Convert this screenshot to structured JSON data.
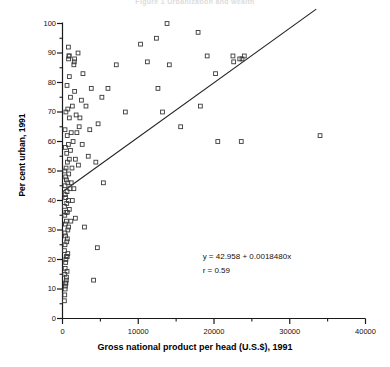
{
  "chart_data": {
    "type": "scatter",
    "title": "Figure 1  Urbanization and wealth",
    "xlabel": "Gross national product per head (U.S.$), 1991",
    "ylabel": "Per cent urban, 1991",
    "xlim": [
      0,
      40000
    ],
    "ylim": [
      0,
      100
    ],
    "xticks": [
      0,
      10000,
      20000,
      30000,
      40000
    ],
    "xtick_labels": [
      "0",
      "10000",
      "20000",
      "30000",
      "40000"
    ],
    "xminor_ticks": [
      5000,
      15000,
      25000,
      35000
    ],
    "yticks": [
      0,
      10,
      20,
      30,
      40,
      50,
      60,
      70,
      80,
      90,
      100
    ],
    "ytick_labels": [
      "0",
      "10",
      "20",
      "30",
      "40",
      "50",
      "60",
      "70",
      "80",
      "90",
      "100"
    ],
    "yminor_ticks": [
      5,
      15,
      25,
      35,
      45,
      55,
      65,
      75,
      85,
      95
    ],
    "grid": false,
    "legend": null,
    "marker": "open-square",
    "annotations": [
      {
        "name": "regression-equation",
        "text": "y = 42.958 + 0.0018480x",
        "x": 18500,
        "y": 21
      },
      {
        "name": "correlation-coefficient",
        "text": "r = 0.59",
        "x": 18500,
        "y": 16
      }
    ],
    "fit_line": {
      "intercept": 42.958,
      "slope": 0.001848,
      "r": 0.59,
      "x_start": 0,
      "x_end": 33500
    },
    "series": [
      {
        "name": "Countries",
        "points": [
          [
            250,
            6
          ],
          [
            300,
            8
          ],
          [
            350,
            10
          ],
          [
            380,
            11
          ],
          [
            420,
            12
          ],
          [
            450,
            12
          ],
          [
            500,
            13
          ],
          [
            520,
            14
          ],
          [
            300,
            15
          ],
          [
            600,
            16
          ],
          [
            350,
            17
          ],
          [
            420,
            19
          ],
          [
            450,
            20
          ],
          [
            500,
            21
          ],
          [
            620,
            21
          ],
          [
            700,
            22
          ],
          [
            260,
            23
          ],
          [
            330,
            25
          ],
          [
            560,
            26
          ],
          [
            640,
            27
          ],
          [
            400,
            28
          ],
          [
            310,
            29
          ],
          [
            700,
            30
          ],
          [
            800,
            31
          ],
          [
            380,
            32
          ],
          [
            520,
            33
          ],
          [
            1100,
            33
          ],
          [
            300,
            35
          ],
          [
            470,
            36
          ],
          [
            640,
            36
          ],
          [
            900,
            37
          ],
          [
            260,
            38
          ],
          [
            560,
            39
          ],
          [
            780,
            40
          ],
          [
            1300,
            40
          ],
          [
            420,
            41
          ],
          [
            350,
            42
          ],
          [
            600,
            43
          ],
          [
            980,
            44
          ],
          [
            1500,
            44
          ],
          [
            330,
            45
          ],
          [
            700,
            46
          ],
          [
            1150,
            46
          ],
          [
            520,
            47
          ],
          [
            420,
            48
          ],
          [
            820,
            49
          ],
          [
            300,
            50
          ],
          [
            470,
            51
          ],
          [
            1250,
            51
          ],
          [
            2100,
            52
          ],
          [
            640,
            53
          ],
          [
            900,
            54
          ],
          [
            1700,
            54
          ],
          [
            560,
            56
          ],
          [
            1050,
            57
          ],
          [
            380,
            58
          ],
          [
            780,
            59
          ],
          [
            2600,
            59
          ],
          [
            1400,
            60
          ],
          [
            620,
            62
          ],
          [
            1150,
            63
          ],
          [
            330,
            64
          ],
          [
            2200,
            65
          ],
          [
            4700,
            66
          ],
          [
            900,
            68
          ],
          [
            1800,
            69
          ],
          [
            450,
            70
          ],
          [
            700,
            71
          ],
          [
            1300,
            72
          ],
          [
            3100,
            72
          ],
          [
            20500,
            60
          ],
          [
            23600,
            60
          ],
          [
            34000,
            62
          ],
          [
            2500,
            74
          ],
          [
            1050,
            75
          ],
          [
            5200,
            75
          ],
          [
            8300,
            70
          ],
          [
            13200,
            70
          ],
          [
            18200,
            72
          ],
          [
            1600,
            77
          ],
          [
            3800,
            78
          ],
          [
            600,
            79
          ],
          [
            12600,
            78
          ],
          [
            900,
            82
          ],
          [
            2700,
            83
          ],
          [
            20200,
            83
          ],
          [
            22600,
            87
          ],
          [
            6000,
            78
          ],
          [
            1500,
            86
          ],
          [
            1550,
            87
          ],
          [
            1600,
            88
          ],
          [
            800,
            88
          ],
          [
            860,
            89
          ],
          [
            880,
            89
          ],
          [
            19100,
            89
          ],
          [
            22500,
            89
          ],
          [
            10300,
            93
          ],
          [
            12400,
            95
          ],
          [
            780,
            92
          ],
          [
            13800,
            100
          ],
          [
            17900,
            97
          ],
          [
            23700,
            88
          ],
          [
            24000,
            89
          ],
          [
            23400,
            88
          ],
          [
            11200,
            87
          ],
          [
            14100,
            86
          ],
          [
            2300,
            68
          ],
          [
            1900,
            63
          ],
          [
            3400,
            55
          ],
          [
            4400,
            53
          ],
          [
            1700,
            34
          ],
          [
            4100,
            13
          ],
          [
            4600,
            24
          ],
          [
            2900,
            31
          ],
          [
            5400,
            46
          ],
          [
            3600,
            64
          ],
          [
            15600,
            65
          ],
          [
            7100,
            86
          ],
          [
            2050,
            90
          ]
        ]
      }
    ]
  }
}
